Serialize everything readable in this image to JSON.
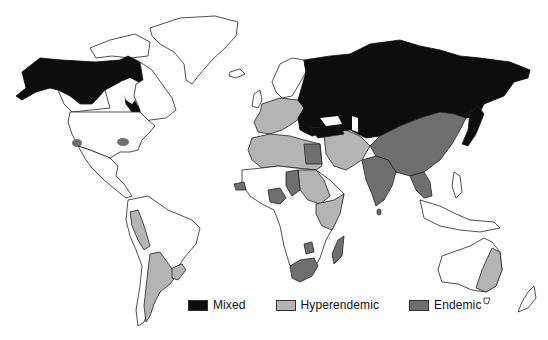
{
  "map": {
    "type": "world choropleth",
    "projection": "world outline",
    "categories": [
      {
        "key": "mixed",
        "label": "Mixed",
        "color": "#0d0d0d"
      },
      {
        "key": "hyperendemic",
        "label": "Hyperendemic",
        "color": "#b4b4b4"
      },
      {
        "key": "endemic",
        "label": "Endemic",
        "color": "#6f6f6f"
      }
    ],
    "regions": {
      "mixed": [
        "Alaska",
        "Canada (interior)",
        "Russia",
        "Eastern Europe",
        "Turkey",
        "Japan"
      ],
      "hyperendemic": [
        "Western Europe",
        "North Africa",
        "Middle East",
        "Sudan",
        "East Africa",
        "Peru",
        "Argentina",
        "Uruguay",
        "Eastern Australia"
      ],
      "endemic": [
        "China",
        "Central Asia",
        "India",
        "Southeast Asia",
        "Egypt",
        "Chad",
        "Nigeria",
        "Senegal",
        "Southern Africa",
        "Madagascar",
        "California (patch)",
        "Central USA (patch)"
      ]
    }
  },
  "legend": {
    "items": [
      {
        "label": "Mixed",
        "color": "#0d0d0d"
      },
      {
        "label": "Hyperendemic",
        "color": "#b4b4b4"
      },
      {
        "label": "Endemic",
        "color": "#6f6f6f"
      }
    ]
  }
}
